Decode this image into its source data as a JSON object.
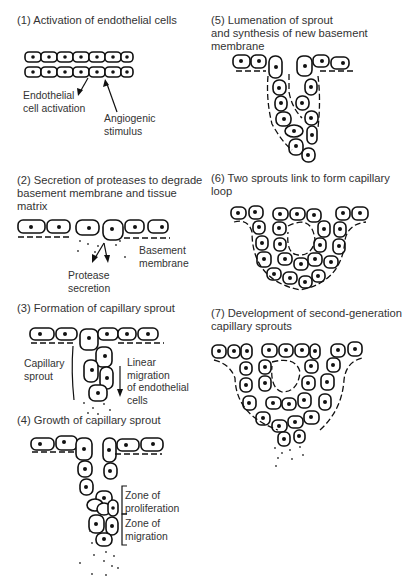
{
  "figure": {
    "panels": [
      {
        "id": 1,
        "title": "(1) Activation of endothelial cells",
        "labels": [
          "Endothelial\ncell activation",
          "Angiogenic\nstimulus"
        ]
      },
      {
        "id": 2,
        "title": "(2) Secretion of proteases to degrade\nbasement membrane and tissue\nmatrix",
        "labels": [
          "Basement\nmembrane",
          "Protease\nsecretion"
        ]
      },
      {
        "id": 3,
        "title": "(3) Formation of capillary sprout",
        "labels": [
          "Capillary\nsprout",
          "Linear\nmigration\nof endothelial\ncells"
        ]
      },
      {
        "id": 4,
        "title": "(4) Growth of capillary sprout",
        "labels": [
          "Zone of\nproliferation",
          "Zone of\nmigration"
        ]
      },
      {
        "id": 5,
        "title": "(5) Lumenation of sprout\nand synthesis of new basement\nmembrane",
        "labels": []
      },
      {
        "id": 6,
        "title": "(6) Two sprouts link to form capillary\nloop",
        "labels": []
      },
      {
        "id": 7,
        "title": "(7) Development of second-generation\ncapillary sprouts",
        "labels": []
      }
    ]
  }
}
